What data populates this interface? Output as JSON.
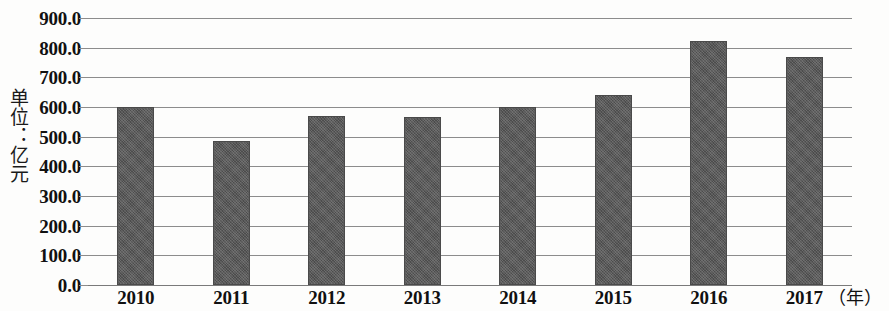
{
  "chart_data": {
    "type": "bar",
    "title": "",
    "subtitle": "",
    "xlabel": "（年）",
    "ylabel": "单位：亿元",
    "categories": [
      "2010",
      "2011",
      "2012",
      "2013",
      "2014",
      "2015",
      "2016",
      "2017"
    ],
    "values": [
      600.0,
      485.0,
      570.0,
      568.0,
      600.0,
      640.0,
      823.0,
      770.0
    ],
    "series": [
      {
        "name": "",
        "values": [
          600.0,
          485.0,
          570.0,
          568.0,
          600.0,
          640.0,
          823.0,
          770.0
        ]
      }
    ],
    "ylim": [
      0,
      900
    ],
    "ytick_labels": [
      "900.0",
      "800.0",
      "700.0",
      "600.0",
      "500.0",
      "400.0",
      "300.0",
      "200.0",
      "100.0",
      "0.0"
    ],
    "ytick_values": [
      900,
      800,
      700,
      600,
      500,
      400,
      300,
      200,
      100,
      0
    ],
    "ytick_step": 100,
    "grid": true,
    "legend": false,
    "legend_position": "none",
    "bar_color": "#5a5a5a",
    "gridline_color": "#8c8c8c",
    "background_color": "#fdfdfc"
  }
}
